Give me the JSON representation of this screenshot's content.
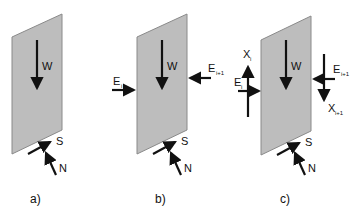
{
  "diagram": {
    "colors": {
      "slice_fill": "#bdbdbd",
      "slice_stroke": "#8a8a8a",
      "arrow": "#111111"
    },
    "panels": [
      {
        "id": "a",
        "caption": "a)",
        "labels": {
          "weight": "W",
          "shear": "S",
          "normal": "N"
        }
      },
      {
        "id": "b",
        "caption": "b)",
        "labels": {
          "weight": "W",
          "shear": "S",
          "normal": "N",
          "e_left": "E",
          "e_left_sub": "i",
          "e_right": "E",
          "e_right_sub": "i+1"
        }
      },
      {
        "id": "c",
        "caption": "c)",
        "labels": {
          "weight": "W",
          "shear": "S",
          "normal": "N",
          "e_left": "E",
          "e_left_sub": "i",
          "e_right": "E",
          "e_right_sub": "i+1",
          "x_left": "X",
          "x_left_sub": "i",
          "x_right": "X",
          "x_right_sub": "i+1"
        }
      }
    ]
  }
}
